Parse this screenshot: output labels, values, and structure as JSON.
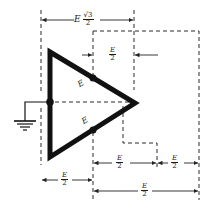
{
  "figure": {
    "type": "three-phase delta voltage geometry diagram",
    "colors": {
      "ink": "#111111",
      "dash": "#2a2a2a",
      "background": "#ffffff"
    }
  },
  "labels": {
    "top_dimension": {
      "var": "E",
      "num": "√3",
      "den": "2"
    },
    "inner_top": {
      "num": "E",
      "den": "2"
    },
    "edge_upper": "E",
    "edge_lower": "E",
    "bottom_left": {
      "num": "E",
      "den": "2"
    },
    "bottom_mid": {
      "num": "E",
      "den": "2"
    },
    "bottom_right": {
      "num": "E",
      "den": "2"
    },
    "bottom_long": {
      "num": "E",
      "den": "2"
    }
  },
  "symbols": {
    "ground": "ground-icon"
  }
}
